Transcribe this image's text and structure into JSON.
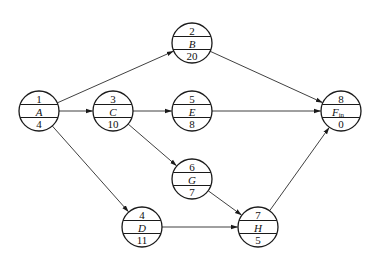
{
  "diagram": {
    "type": "activity-on-node network",
    "nodes": [
      {
        "id": "1",
        "activity": "A",
        "duration": "4",
        "x": 39,
        "y": 111
      },
      {
        "id": "2",
        "activity": "B",
        "duration": "20",
        "x": 192,
        "y": 43
      },
      {
        "id": "3",
        "activity": "C",
        "duration": "10",
        "x": 113,
        "y": 111
      },
      {
        "id": "4",
        "activity": "D",
        "duration": "11",
        "x": 142,
        "y": 227
      },
      {
        "id": "5",
        "activity": "E",
        "duration": "8",
        "x": 192,
        "y": 111
      },
      {
        "id": "6",
        "activity": "G",
        "duration": "7",
        "x": 192,
        "y": 179
      },
      {
        "id": "7",
        "activity": "H",
        "duration": "5",
        "x": 258,
        "y": 227
      },
      {
        "id": "8",
        "activity": "F",
        "activity_sub": "in",
        "duration": "0",
        "x": 341,
        "y": 111
      }
    ],
    "edges": [
      {
        "from": "A",
        "to": "B"
      },
      {
        "from": "A",
        "to": "C"
      },
      {
        "from": "A",
        "to": "D"
      },
      {
        "from": "C",
        "to": "E"
      },
      {
        "from": "C",
        "to": "G"
      },
      {
        "from": "B",
        "to": "F"
      },
      {
        "from": "E",
        "to": "F"
      },
      {
        "from": "G",
        "to": "H"
      },
      {
        "from": "D",
        "to": "H"
      },
      {
        "from": "H",
        "to": "F"
      }
    ],
    "colors": {
      "stroke": "#1a1a1a",
      "background": "#ffffff"
    }
  }
}
